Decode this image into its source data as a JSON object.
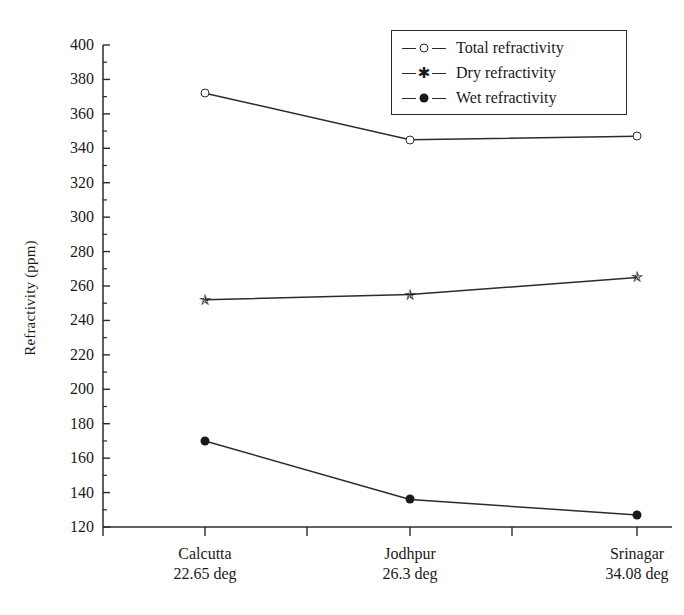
{
  "chart_data": {
    "type": "line",
    "title": "",
    "xlabel": "",
    "ylabel": "Refractivity (ppm)",
    "categories": [
      "Calcutta",
      "Jodhpur",
      "Srinagar"
    ],
    "category_sublabels": [
      "22.65 deg",
      "26.3 deg",
      "34.08 deg"
    ],
    "ylim": [
      120,
      400
    ],
    "ytick_labels": [
      "400",
      "380",
      "360",
      "340",
      "320",
      "300",
      "280",
      "260",
      "240",
      "220",
      "200",
      "180",
      "160",
      "140",
      "120"
    ],
    "ytick_values": [
      400,
      380,
      360,
      340,
      320,
      300,
      280,
      260,
      240,
      220,
      200,
      180,
      160,
      140,
      120
    ],
    "yminor_step": 10,
    "grid": false,
    "legend_position": "top-right",
    "series": [
      {
        "name": "Total refractivity",
        "marker": "open-circle",
        "values": [
          372,
          345,
          347
        ]
      },
      {
        "name": "Dry refractivity",
        "marker": "star",
        "values": [
          252,
          255,
          265
        ]
      },
      {
        "name": "Wet refractivity",
        "marker": "filled-circle",
        "values": [
          170,
          136,
          127
        ]
      }
    ],
    "colors": {
      "axis": "#2b2b2b",
      "line": "#2b2b2b",
      "marker": "#1a1a1a",
      "background": "#ffffff"
    }
  },
  "legend": {
    "items": [
      {
        "label": "Total refractivity",
        "marker": "open-circle"
      },
      {
        "label": "Dry refractivity",
        "marker": "star"
      },
      {
        "label": "Wet refractivity",
        "marker": "filled-circle"
      }
    ]
  },
  "axis": {
    "y_title": "Refractivity (ppm)"
  }
}
